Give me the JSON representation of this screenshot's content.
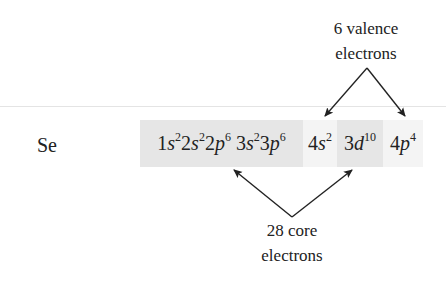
{
  "element": {
    "symbol": "Se"
  },
  "configuration": {
    "groups": [
      {
        "name": "core",
        "shade": "#e6e6e6",
        "x": 140,
        "width": 163,
        "orbitals": [
          {
            "n": "1",
            "l": "s",
            "e": "2"
          },
          {
            "n": "2",
            "l": "s",
            "e": "2"
          },
          {
            "n": "2",
            "l": "p",
            "e": "6"
          },
          {
            "n": " 3",
            "l": "s",
            "e": "2"
          },
          {
            "n": "3",
            "l": "p",
            "e": "6"
          }
        ]
      },
      {
        "name": "valence-4s",
        "shade": "#f4f4f4",
        "x": 303,
        "width": 34,
        "orbitals": [
          {
            "n": "4",
            "l": "s",
            "e": "2"
          }
        ]
      },
      {
        "name": "core-3d",
        "shade": "#e6e6e6",
        "x": 337,
        "width": 46,
        "orbitals": [
          {
            "n": "3",
            "l": "d",
            "e": "10"
          }
        ]
      },
      {
        "name": "valence-4p",
        "shade": "#f4f4f4",
        "x": 383,
        "width": 40,
        "orbitals": [
          {
            "n": "4",
            "l": "p",
            "e": "4"
          }
        ]
      }
    ]
  },
  "annotations": {
    "valence": {
      "line1": "6 valence",
      "line2": "electrons",
      "count": 6
    },
    "core": {
      "line1": "28 core",
      "line2": "electrons",
      "count": 28
    }
  },
  "colors": {
    "text": "#222222",
    "core_shade": "#e6e6e6",
    "valence_shade": "#f4f4f4",
    "arrow": "#222222",
    "rule": "#e4e4e4"
  }
}
